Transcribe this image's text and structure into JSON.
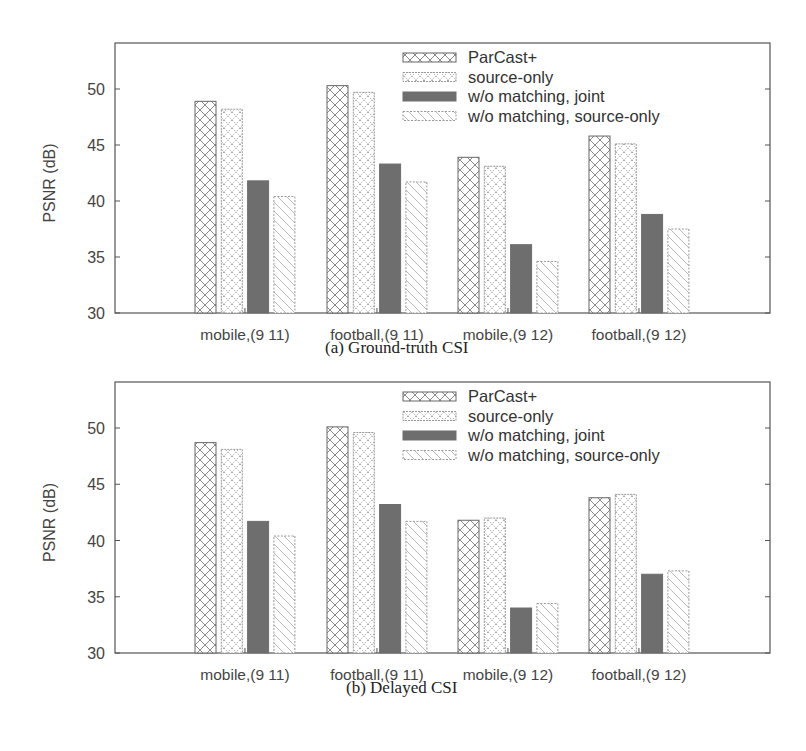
{
  "chart_data": [
    {
      "type": "bar",
      "title": "(a) Ground-truth CSI",
      "xlabel": "",
      "ylabel": "PSNR (dB)",
      "ylim": [
        30,
        54
      ],
      "yticks": [
        30,
        35,
        40,
        45,
        50
      ],
      "grid": false,
      "legend_position": "top-right",
      "categories": [
        "mobile,(9 11)",
        "football,(9 11)",
        "mobile,(9 12)",
        "football,(9 12)"
      ],
      "series": [
        {
          "name": "ParCast+",
          "pattern": "crosshatch",
          "values": [
            48.9,
            50.3,
            43.9,
            45.8
          ]
        },
        {
          "name": "source-only",
          "pattern": "dotted-crosshatch",
          "values": [
            48.2,
            49.7,
            43.1,
            45.1
          ]
        },
        {
          "name": "w/o matching, joint",
          "pattern": "solid-gray",
          "values": [
            41.8,
            43.3,
            36.1,
            38.8
          ]
        },
        {
          "name": "w/o matching, source-only",
          "pattern": "diagonal",
          "values": [
            40.4,
            41.7,
            34.6,
            37.5
          ]
        }
      ]
    },
    {
      "type": "bar",
      "title": "(b) Delayed CSI",
      "xlabel": "",
      "ylabel": "PSNR (dB)",
      "ylim": [
        30,
        54
      ],
      "yticks": [
        30,
        35,
        40,
        45,
        50
      ],
      "grid": false,
      "legend_position": "top-right",
      "categories": [
        "mobile,(9 11)",
        "football,(9 11)",
        "mobile,(9 12)",
        "football,(9 12)"
      ],
      "series": [
        {
          "name": "ParCast+",
          "pattern": "crosshatch",
          "values": [
            48.7,
            50.1,
            41.8,
            43.8
          ]
        },
        {
          "name": "source-only",
          "pattern": "dotted-crosshatch",
          "values": [
            48.1,
            49.6,
            42.0,
            44.1
          ]
        },
        {
          "name": "w/o matching, joint",
          "pattern": "solid-gray",
          "values": [
            41.7,
            43.2,
            34.0,
            37.0
          ]
        },
        {
          "name": "w/o matching, source-only",
          "pattern": "diagonal",
          "values": [
            40.4,
            41.7,
            34.4,
            37.3
          ]
        }
      ]
    }
  ],
  "colors": {
    "frame": "#555555",
    "joint_fill": "#6e6e6e",
    "pattern_stroke": "#8a8a8a"
  }
}
